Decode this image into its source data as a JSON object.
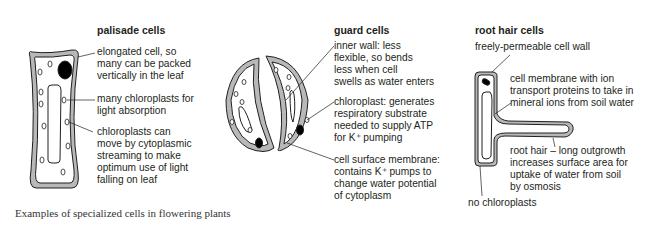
{
  "palisade": {
    "title": "palisade cells",
    "labels": [
      [
        "elongated cell, so",
        "many can be packed",
        "vertically in the leaf"
      ],
      [
        "many chloroplasts for",
        "light absorption"
      ],
      [
        "chloroplasts can",
        "move by cytoplasmic",
        "streaming to make",
        "optimum use of light",
        "falling on leaf"
      ]
    ]
  },
  "guard": {
    "title": "guard cells",
    "labels": [
      [
        "inner wall: less",
        "flexible, so bends",
        "less when cell",
        "swells as water enters"
      ],
      [
        "chloroplast: generates",
        "respiratory substrate",
        "needed to supply ATP",
        "for K⁺ pumping"
      ],
      [
        "cell surface membrane:",
        "contains K⁺ pumps to",
        "change water potential",
        "of cytoplasm"
      ]
    ]
  },
  "roothair": {
    "title": "root hair cells",
    "labels": [
      [
        "freely-permeable cell wall"
      ],
      [
        "cell membrane with ion",
        "transport proteins to take in",
        "mineral ions from soil water"
      ],
      [
        "root hair – long outgrowth",
        "increases surface area for",
        "uptake of water from soil",
        "by osmosis"
      ],
      [
        "no chloroplasts"
      ]
    ]
  },
  "caption": "Examples of specialized cells in flowering plants",
  "colors": {
    "wall": "#b8b8b8",
    "outline": "#231f20",
    "nucleus": "#000000"
  }
}
